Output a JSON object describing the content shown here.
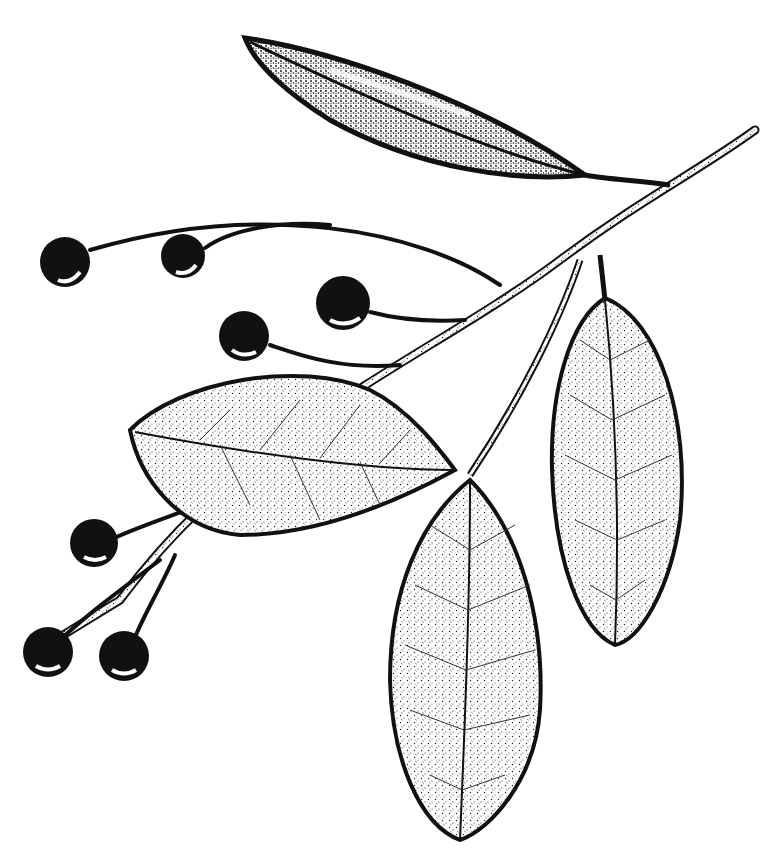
{
  "illustration": {
    "subject": "Pen-and-ink botanical illustration of a branch with leaves and berries",
    "style": "black ink stipple and line drawing on white",
    "colors": {
      "ink": "#111111",
      "background": "#ffffff"
    },
    "elements": {
      "leaves": 5,
      "berries": 9,
      "branch": 1
    }
  }
}
